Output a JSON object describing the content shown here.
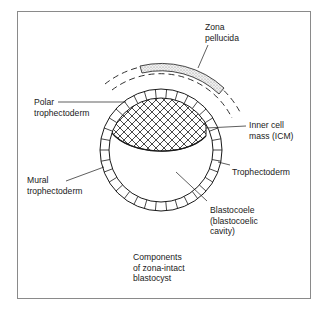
{
  "diagram": {
    "title_lines": [
      "Components",
      "of zona-intact",
      "blastocyst"
    ],
    "labels": {
      "zona_pellucida": [
        "Zona",
        "pellucida"
      ],
      "polar_trophectoderm": [
        "Polar",
        "trophectoderm"
      ],
      "inner_cell_mass": [
        "Inner cell",
        "mass (ICM)"
      ],
      "mural_trophectoderm": [
        "Mural",
        "trophectoderm"
      ],
      "trophectoderm": [
        "Trophectoderm"
      ],
      "blastocoele": [
        "Blastocoele",
        "(blastocoelic",
        "cavity)"
      ]
    },
    "colors": {
      "line": "#1a1a1a",
      "frame": "#8a8a8a",
      "zona_fill": "#e4e4e4"
    }
  }
}
